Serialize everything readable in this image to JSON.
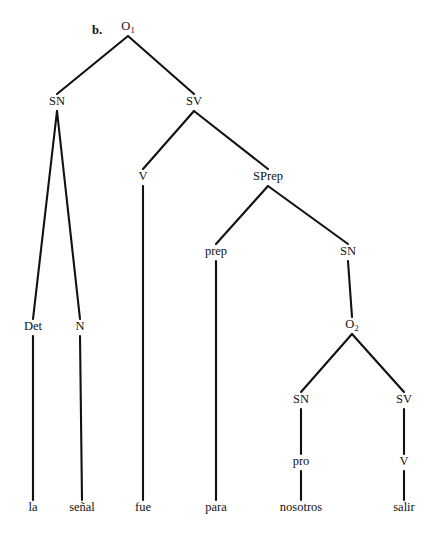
{
  "figure": {
    "example_label": "b.",
    "kind": "syntactic-constituency-tree",
    "sentence": "la señal fue para nosotros salir",
    "ink_color": "#111111",
    "background_color": "#ffffff"
  },
  "nodes": [
    {
      "id": "O1",
      "label": "O",
      "subscript": "1",
      "x": 128,
      "y": 30,
      "terminal": false
    },
    {
      "id": "SN1",
      "label": "SN",
      "subscript": "",
      "x": 57,
      "y": 105,
      "terminal": false
    },
    {
      "id": "SV1",
      "label": "SV",
      "subscript": "",
      "x": 194,
      "y": 105,
      "terminal": false
    },
    {
      "id": "Det",
      "label": "Det",
      "subscript": "",
      "x": 33,
      "y": 330,
      "terminal": false
    },
    {
      "id": "N",
      "label": "N",
      "subscript": "",
      "x": 80,
      "y": 330,
      "terminal": false
    },
    {
      "id": "V1",
      "label": "V",
      "subscript": "",
      "x": 143,
      "y": 180,
      "terminal": false
    },
    {
      "id": "SPrep",
      "label": "SPrep",
      "subscript": "",
      "x": 268,
      "y": 180,
      "terminal": false
    },
    {
      "id": "prep",
      "label": "prep",
      "subscript": "",
      "x": 216,
      "y": 255,
      "terminal": false
    },
    {
      "id": "SN2",
      "label": "SN",
      "subscript": "",
      "x": 348,
      "y": 255,
      "terminal": false
    },
    {
      "id": "O2",
      "label": "O",
      "subscript": "2",
      "x": 352,
      "y": 328,
      "terminal": false
    },
    {
      "id": "SN3",
      "label": "SN",
      "subscript": "",
      "x": 301,
      "y": 403,
      "terminal": false
    },
    {
      "id": "SV2",
      "label": "SV",
      "subscript": "",
      "x": 404,
      "y": 403,
      "terminal": false
    },
    {
      "id": "pro",
      "label": "pro",
      "subscript": "",
      "x": 301,
      "y": 465,
      "terminal": false
    },
    {
      "id": "V2",
      "label": "V",
      "subscript": "",
      "x": 404,
      "y": 465,
      "terminal": false
    },
    {
      "id": "w_la",
      "label": "la",
      "subscript": "",
      "x": 33,
      "y": 511,
      "terminal": true
    },
    {
      "id": "w_senal",
      "label": "señal",
      "subscript": "",
      "x": 82,
      "y": 511,
      "terminal": true
    },
    {
      "id": "w_fue",
      "label": "fue",
      "subscript": "",
      "x": 143,
      "y": 511,
      "terminal": true
    },
    {
      "id": "w_para",
      "label": "para",
      "subscript": "",
      "x": 216,
      "y": 511,
      "terminal": true
    },
    {
      "id": "w_nosotros",
      "label": "nosotros",
      "subscript": "",
      "x": 301,
      "y": 511,
      "terminal": true
    },
    {
      "id": "w_salir",
      "label": "salir",
      "subscript": "",
      "x": 404,
      "y": 511,
      "terminal": true
    }
  ],
  "edges": [
    {
      "from": "O1",
      "to": "SN1"
    },
    {
      "from": "O1",
      "to": "SV1"
    },
    {
      "from": "SN1",
      "to": "Det"
    },
    {
      "from": "SN1",
      "to": "N"
    },
    {
      "from": "SV1",
      "to": "V1"
    },
    {
      "from": "SV1",
      "to": "SPrep"
    },
    {
      "from": "SPrep",
      "to": "prep"
    },
    {
      "from": "SPrep",
      "to": "SN2"
    },
    {
      "from": "SN2",
      "to": "O2"
    },
    {
      "from": "O2",
      "to": "SN3"
    },
    {
      "from": "O2",
      "to": "SV2"
    },
    {
      "from": "SN3",
      "to": "pro"
    },
    {
      "from": "SV2",
      "to": "V2"
    },
    {
      "from": "Det",
      "to": "w_la"
    },
    {
      "from": "N",
      "to": "w_senal"
    },
    {
      "from": "V1",
      "to": "w_fue"
    },
    {
      "from": "prep",
      "to": "w_para"
    },
    {
      "from": "pro",
      "to": "w_nosotros"
    },
    {
      "from": "V2",
      "to": "w_salir"
    }
  ],
  "example_label_pos": {
    "x": 97,
    "y": 34
  }
}
